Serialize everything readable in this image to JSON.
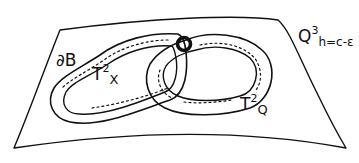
{
  "diagram": {
    "stroke_color": "#111111",
    "background": "#ffffff",
    "surface": {
      "label_base": "Q",
      "label_sup": "3",
      "label_sub": "h=c-ε"
    },
    "boundary": {
      "label": "∂B"
    },
    "torus_x": {
      "label_base": "T",
      "label_sup": "2",
      "label_sub": "X"
    },
    "torus_q": {
      "label_base": "T",
      "label_sup": "2",
      "label_sub": "Q"
    },
    "intersection_point": {
      "style": "thick circle"
    }
  }
}
